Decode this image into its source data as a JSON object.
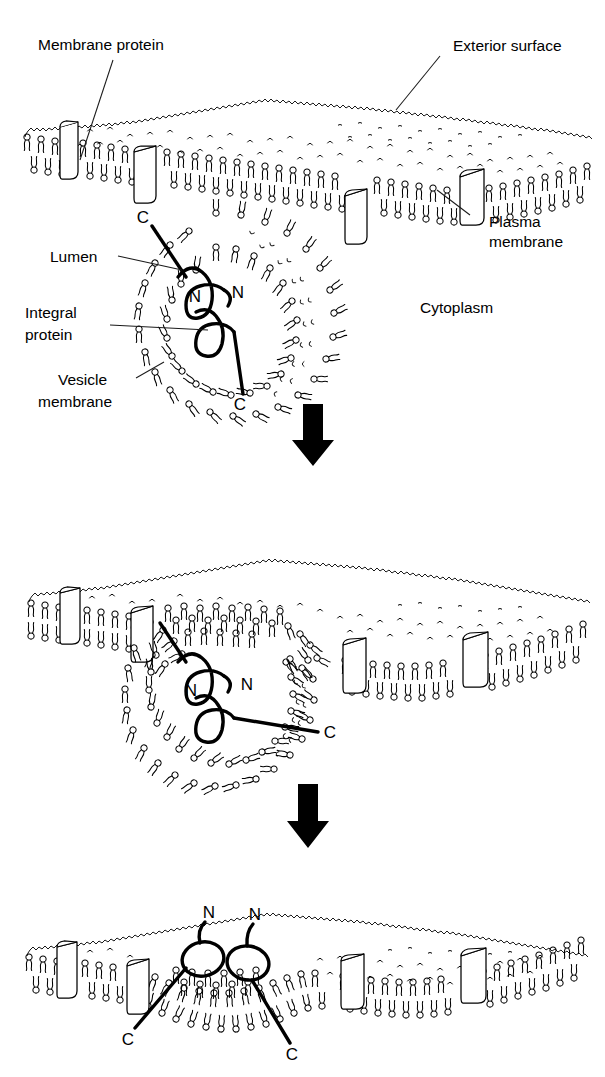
{
  "figure": {
    "background_color": "#ffffff",
    "ink_color": "#000000",
    "width": 605,
    "height": 1077
  },
  "labels": {
    "membrane_protein": "Membrane protein",
    "exterior_surface": "Exterior surface",
    "plasma_membrane_line1": "Plasma",
    "plasma_membrane_line2": "membrane",
    "lumen": "Lumen",
    "integral_protein_line1": "Integral",
    "integral_protein_line2": "protein",
    "vesicle_membrane_line1": "Vesicle",
    "vesicle_membrane_line2": "membrane",
    "cytoplasm": "Cytoplasm"
  },
  "termini": {
    "n": "N",
    "c": "C"
  },
  "panels": [
    {
      "id": "panel-1",
      "name": "vesicle-approaching-membrane",
      "terminus_markers": [
        {
          "label": "C",
          "x": 146,
          "y": 219
        },
        {
          "label": "N",
          "x": 195,
          "y": 296
        },
        {
          "label": "N",
          "x": 235,
          "y": 293
        },
        {
          "label": "C",
          "x": 232,
          "y": 404
        }
      ]
    },
    {
      "id": "panel-2",
      "name": "vesicle-fusing-with-membrane",
      "terminus_markers": [
        {
          "label": "N",
          "x": 191,
          "y": 690
        },
        {
          "label": "N",
          "x": 244,
          "y": 685
        },
        {
          "label": "C",
          "x": 326,
          "y": 731
        }
      ]
    },
    {
      "id": "panel-3",
      "name": "protein-inserted-in-plasma-membrane",
      "terminus_markers": [
        {
          "label": "N",
          "x": 209,
          "y": 934
        },
        {
          "label": "N",
          "x": 250,
          "y": 936
        },
        {
          "label": "C",
          "x": 125,
          "y": 1044
        },
        {
          "label": "C",
          "x": 283,
          "y": 1058
        }
      ]
    }
  ],
  "arrows": [
    {
      "id": "arrow-1",
      "direction": "down",
      "x": 313,
      "y": 404,
      "height": 60
    },
    {
      "id": "arrow-2",
      "direction": "down",
      "x": 308,
      "y": 784,
      "height": 62
    }
  ],
  "icons": {
    "down_arrow": "down-arrow-icon",
    "phospholipid": "phospholipid-icon",
    "membrane_protein_box": "membrane-protein-box-icon"
  }
}
